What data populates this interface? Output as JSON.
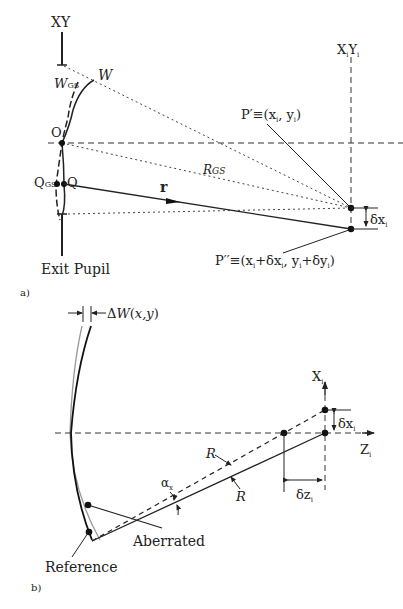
{
  "panel_a": {
    "tag": "a)",
    "axis_xy": "XY",
    "axis_image": "X",
    "axis_image_sub": "i",
    "axis_image2": "Y",
    "axis_image2_sub": "i",
    "W": "W",
    "W_GS": "W",
    "W_GS_sub": "GS",
    "O": "O",
    "Q": "Q",
    "Q_GS": "Q",
    "Q_GS_sub": "GS",
    "r": "r",
    "R_GS": "R",
    "R_GS_sub": "GS",
    "P_prime": "P′≡(x",
    "P_prime_rest": ", y",
    "P_prime_end": ")",
    "P_double": "P′′≡(x",
    "P_double_mid1": "+δx",
    "P_double_mid2": ", y",
    "P_double_mid3": "+δy",
    "P_double_end": ")",
    "sub_i": "i",
    "delta_x": "δx",
    "exit_pupil": "Exit Pupil"
  },
  "panel_b": {
    "tag": "b)",
    "delta_W": "ΔW(x,y)",
    "axis_x": "X",
    "axis_z": "Z",
    "sub_i": "i",
    "delta_x": "δx",
    "delta_z": "δz",
    "R1": "R",
    "R2": "R",
    "alpha": "α",
    "alpha_sub": "x",
    "aberrated": "Aberrated",
    "reference": "Reference"
  }
}
